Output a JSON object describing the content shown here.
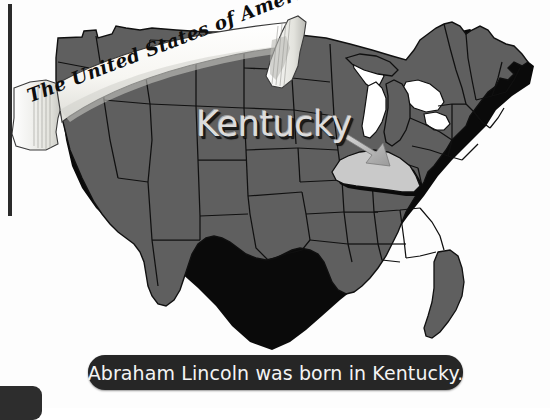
{
  "banner": {
    "title": "The United States of America",
    "ribbon_color": "#f7f6f2",
    "ribbon_shade": "#b9b9b4"
  },
  "map": {
    "name": "united-states-map",
    "state_fill": "#5f5f5f",
    "state_border": "#101010",
    "highlight_fill": "#c9c9c9",
    "shadow_color": "#0a0a0a",
    "highlighted_state": "Kentucky",
    "label": "Kentucky",
    "pointer": "arrow-icon"
  },
  "caption": {
    "text": "Abraham Lincoln was born in Kentucky.",
    "background": "#262626",
    "color": "#f4f4f4"
  },
  "decor": {
    "left_rule_color": "#2a2a2a",
    "corner_block_color": "#2d2d2d"
  }
}
